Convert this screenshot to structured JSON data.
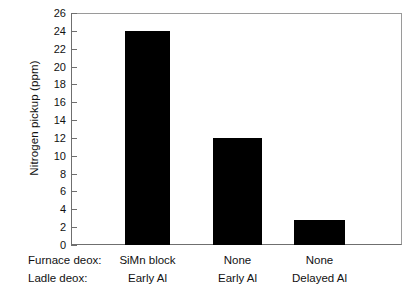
{
  "chart_data": {
    "type": "bar",
    "title": "",
    "xlabel": "",
    "ylabel": "Nitrogen pickup (ppm)",
    "ylim": [
      0,
      26
    ],
    "ytick_step": 2,
    "yticks": [
      0,
      2,
      4,
      6,
      8,
      10,
      12,
      14,
      16,
      18,
      20,
      22,
      24,
      26
    ],
    "grid": false,
    "legend": "none",
    "bar_color": "#000000",
    "categories": [
      "SiMn block / Early Al",
      "None / Early Al",
      "None / Delayed Al"
    ],
    "values": [
      24.0,
      12.0,
      2.8
    ],
    "group_labels": {
      "row_headers": [
        "Furnace deox:",
        "Ladle deox:"
      ],
      "columns": [
        {
          "furnace_deox": "SiMn block",
          "ladle_deox": "Early Al"
        },
        {
          "furnace_deox": "None",
          "ladle_deox": "Early Al"
        },
        {
          "furnace_deox": "None",
          "ladle_deox": "Delayed Al"
        }
      ]
    }
  },
  "axis": {
    "y_title": "Nitrogen pickup (ppm)",
    "tick_labels": [
      "26",
      "24",
      "22",
      "20",
      "18",
      "16",
      "14",
      "12",
      "10",
      "8",
      "6",
      "4",
      "2",
      "0"
    ]
  },
  "bars": [
    {
      "label": "SiMn block / Early Al",
      "value": 24.0
    },
    {
      "label": "None / Early Al",
      "value": 12.0
    },
    {
      "label": "None / Delayed Al",
      "value": 2.8
    }
  ],
  "bottom_labels": {
    "row1_header": "Furnace deox:",
    "row2_header": "Ladle deox:",
    "col1_row1": "SiMn block",
    "col1_row2": "Early Al",
    "col2_row1": "None",
    "col2_row2": "Early Al",
    "col3_row1": "None",
    "col3_row2": "Delayed Al"
  }
}
